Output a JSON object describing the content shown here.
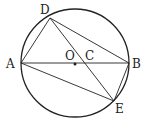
{
  "diagram": {
    "type": "circle-geometry",
    "circle": {
      "center": "O",
      "cx": 75,
      "cy": 63,
      "r": 54
    },
    "points": {
      "A": {
        "label": "A",
        "x": 21,
        "y": 63,
        "lx": 6,
        "ly": 68
      },
      "B": {
        "label": "B",
        "x": 129,
        "y": 63,
        "lx": 133,
        "ly": 68
      },
      "D": {
        "label": "D",
        "x": 50,
        "y": 18,
        "lx": 40,
        "ly": 14
      },
      "E": {
        "label": "E",
        "x": 114,
        "y": 101,
        "lx": 115,
        "ly": 113
      },
      "O": {
        "label": "O",
        "x": 75,
        "y": 64,
        "lx": 65,
        "ly": 60
      },
      "C": {
        "label": "C",
        "x": 87,
        "y": 63,
        "lx": 86,
        "ly": 60
      }
    },
    "segments": [
      "AB",
      "AD",
      "DB",
      "DE",
      "AE",
      "BE"
    ],
    "stroke_color": "#222222"
  }
}
